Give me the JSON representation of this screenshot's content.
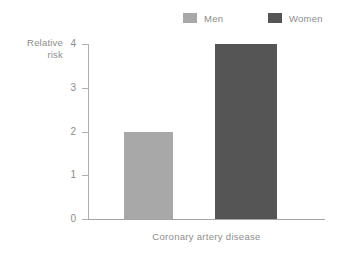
{
  "chart_data": {
    "type": "bar",
    "title": "",
    "subtitle": "",
    "categories": [
      "Coronary artery disease"
    ],
    "series": [
      {
        "name": "Men",
        "values": [
          2
        ],
        "color": "#a8a8a8"
      },
      {
        "name": "Women",
        "values": [
          4
        ],
        "color": "#555555"
      }
    ],
    "xlabel": "Coronary artery disease",
    "ylabel": "Relative risk",
    "ylabel_line1": "Relative",
    "ylabel_line2": "risk",
    "ylim": [
      0,
      4
    ],
    "yticks": [
      "0",
      "1",
      "2",
      "3",
      "4"
    ],
    "ytick_values": [
      0,
      1,
      2,
      3,
      4
    ],
    "grid": false,
    "legend_position": "top-right"
  },
  "legend": {
    "items": [
      {
        "label": "Men",
        "color": "#a8a8a8"
      },
      {
        "label": "Women",
        "color": "#555555"
      }
    ]
  },
  "axes": {
    "y_title_line1": "Relative",
    "y_title_line2": "risk",
    "x_title": "Coronary artery disease",
    "tick_0": "0",
    "tick_1": "1",
    "tick_2": "2",
    "tick_3": "3",
    "tick_4": "4"
  },
  "colors": {
    "men_bar": "#a8a8a8",
    "women_bar": "#555555",
    "axis": "#b0b0b0",
    "text": "#8d8d8d",
    "background": "#ffffff"
  }
}
